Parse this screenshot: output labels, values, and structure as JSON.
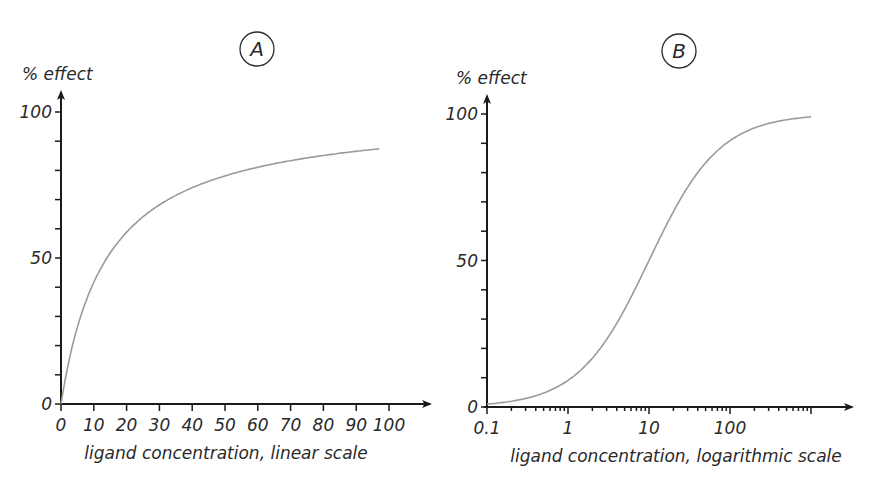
{
  "chart_data": [
    {
      "panel": "A",
      "type": "line",
      "title": "A",
      "xlabel": "ligand concentration, linear scale",
      "ylabel": "% effect",
      "x_scale": "linear",
      "xlim": [
        0,
        100
      ],
      "ylim": [
        0,
        100
      ],
      "x_ticks": [
        0,
        10,
        20,
        30,
        40,
        50,
        60,
        70,
        80,
        90,
        100
      ],
      "x_tick_labels": [
        "0",
        "10",
        "20",
        "30",
        "40",
        "50",
        "60",
        "70",
        "80",
        "90",
        "100"
      ],
      "y_ticks": [
        0,
        10,
        20,
        30,
        40,
        50,
        60,
        70,
        80,
        90,
        100
      ],
      "y_tick_labels": [
        "0",
        "",
        "",
        "",
        "",
        "50",
        "",
        "",
        "",
        "",
        "100"
      ],
      "grid": false,
      "legend": null,
      "curve_color": "#9a9a9a",
      "series": [
        {
          "name": "response",
          "x": [
            0,
            1,
            2,
            3,
            5,
            7,
            10,
            15,
            20,
            25,
            30,
            40,
            50,
            60,
            70,
            80,
            90,
            97
          ],
          "y": [
            0,
            6.7,
            12.5,
            17.6,
            26.3,
            33.3,
            41.7,
            51.7,
            58.8,
            64.1,
            68.2,
            74.1,
            78.1,
            81.1,
            83.3,
            85.1,
            86.5,
            87.4
          ]
        }
      ]
    },
    {
      "panel": "B",
      "type": "line",
      "title": "B",
      "xlabel": "ligand concentration, logarithmic scale",
      "ylabel": "% effect",
      "x_scale": "log",
      "xlim": [
        0.1,
        1000
      ],
      "ylim": [
        0,
        100
      ],
      "x_ticks": [
        0.1,
        1,
        10,
        100,
        1000
      ],
      "x_tick_labels": [
        "0.1",
        "1",
        "10",
        "100",
        ""
      ],
      "y_ticks": [
        0,
        10,
        20,
        30,
        40,
        50,
        60,
        70,
        80,
        90,
        100
      ],
      "y_tick_labels": [
        "0",
        "",
        "",
        "",
        "",
        "50",
        "",
        "",
        "",
        "",
        "100"
      ],
      "grid": false,
      "legend": null,
      "curve_color": "#9a9a9a",
      "series": [
        {
          "name": "response",
          "x": [
            0.1,
            0.2,
            0.3,
            0.5,
            0.7,
            1,
            2,
            3,
            5,
            7,
            10,
            20,
            30,
            50,
            70,
            100,
            200,
            300,
            500,
            700,
            1000
          ],
          "y": [
            1.0,
            2.0,
            2.9,
            4.8,
            6.5,
            9.1,
            16.7,
            23.1,
            33.3,
            41.2,
            50.0,
            66.7,
            75.0,
            83.3,
            87.5,
            90.9,
            95.2,
            96.8,
            98.0,
            98.6,
            99.0
          ]
        }
      ]
    }
  ]
}
